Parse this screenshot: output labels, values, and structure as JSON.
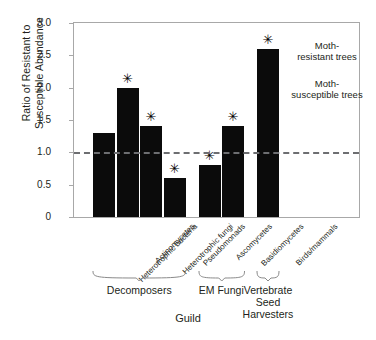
{
  "chart_data": {
    "type": "bar",
    "title": "",
    "xlabel": "Guild",
    "ylabel": "Ratio of Resistant to Susceptible Abundance",
    "ylabel_lines": [
      "Ratio of Resistant to",
      "Susceptible Abundance"
    ],
    "ylim": [
      0,
      3.0
    ],
    "yticks": [
      "0",
      "0.5",
      "1.0",
      "1.5",
      "2.0",
      "2.5",
      "3.0"
    ],
    "ytick_values": [
      0,
      0.5,
      1.0,
      1.5,
      2.0,
      2.5,
      3.0
    ],
    "grid": false,
    "legend": "none",
    "bar_color": "#0b0b0b",
    "reference_line": {
      "value": 1.0,
      "style": "dashed",
      "color": "#6d6e71",
      "label_above": "Moth-\nresistant trees",
      "label_below": "Moth-\nsusceptible trees"
    },
    "annotations": {
      "above_line_line1": "Moth-",
      "above_line_line2": "resistant trees",
      "below_line_line1": "Moth-",
      "below_line_line2": "susceptible trees",
      "significance_marker": "✳",
      "significance_note": "asterisk marks significant deviation from 1.0"
    },
    "categories": [
      "Heterotrophic bacteria",
      "Actinomycetes",
      "Heterotrophic fungi",
      "Pseudomonads",
      "Ascomycetes",
      "Basidiomycetes",
      "Birds/mammals"
    ],
    "values": [
      1.3,
      2.0,
      1.4,
      0.6,
      0.8,
      1.4,
      2.6
    ],
    "significant": [
      false,
      true,
      true,
      true,
      true,
      true,
      true
    ],
    "groups": [
      {
        "label": "Decomposers",
        "label_lines": [
          "Decomposers"
        ],
        "members": [
          0,
          1,
          2,
          3
        ]
      },
      {
        "label": "EM Fungi",
        "label_lines": [
          "EM Fungi"
        ],
        "members": [
          4,
          5
        ]
      },
      {
        "label": "Vertebrate Seed Harvesters",
        "label_lines": [
          "Vertebrate",
          "Seed Harvesters"
        ],
        "members": [
          6
        ]
      }
    ]
  }
}
